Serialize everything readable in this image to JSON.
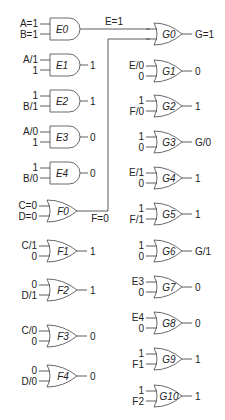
{
  "diagram": {
    "title": "",
    "and_gates": [
      {
        "name": "E0",
        "in1": "A=1",
        "in2": "B=1",
        "out": "E=1",
        "y": 29
      },
      {
        "name": "E1",
        "in1": "A/1",
        "in2": "1",
        "out": "1",
        "y": 65
      },
      {
        "name": "E2",
        "in1": "1",
        "in2": "B/1",
        "out": "1",
        "y": 101
      },
      {
        "name": "E3",
        "in1": "A/0",
        "in2": "1",
        "out": "0",
        "y": 137
      },
      {
        "name": "E4",
        "in1": "1",
        "in2": "B/0",
        "out": "0",
        "y": 173
      }
    ],
    "or_gates_left": [
      {
        "name": "F0",
        "in1": "C=0",
        "in2": "D=0",
        "out": "F=0",
        "y": 211
      },
      {
        "name": "F1",
        "in1": "C/1",
        "in2": "0",
        "out": "1",
        "y": 251
      },
      {
        "name": "F2",
        "in1": "0",
        "in2": "D/1",
        "out": "1",
        "y": 290
      },
      {
        "name": "F3",
        "in1": "C/0",
        "in2": "0",
        "out": "0",
        "y": 336
      },
      {
        "name": "F4",
        "in1": "0",
        "in2": "D/0",
        "out": "0",
        "y": 376
      }
    ],
    "or_gates_right": [
      {
        "name": "G0",
        "in1": "",
        "in2": "",
        "out": "G=1",
        "y": 34
      },
      {
        "name": "G1",
        "in1": "E/0",
        "in2": "0",
        "out": "0",
        "y": 71
      },
      {
        "name": "G2",
        "in1": "1",
        "in2": "F/0",
        "out": "1",
        "y": 106
      },
      {
        "name": "G3",
        "in1": "1",
        "in2": "0",
        "out": "G/0",
        "y": 142
      },
      {
        "name": "G4",
        "in1": "E/1",
        "in2": "0",
        "out": "1",
        "y": 178
      },
      {
        "name": "G5",
        "in1": "1",
        "in2": "F/1",
        "out": "1",
        "y": 214
      },
      {
        "name": "G6",
        "in1": "1",
        "in2": "0",
        "out": "G/1",
        "y": 251
      },
      {
        "name": "G7",
        "in1": "E3",
        "in2": "0",
        "out": "0",
        "y": 287
      },
      {
        "name": "G8",
        "in1": "E4",
        "in2": "0",
        "out": "0",
        "y": 323
      },
      {
        "name": "G9",
        "in1": "1",
        "in2": "F1",
        "out": "1",
        "y": 359
      },
      {
        "name": "G10",
        "in1": "1",
        "in2": "F2",
        "out": "1",
        "y": 396
      }
    ]
  }
}
